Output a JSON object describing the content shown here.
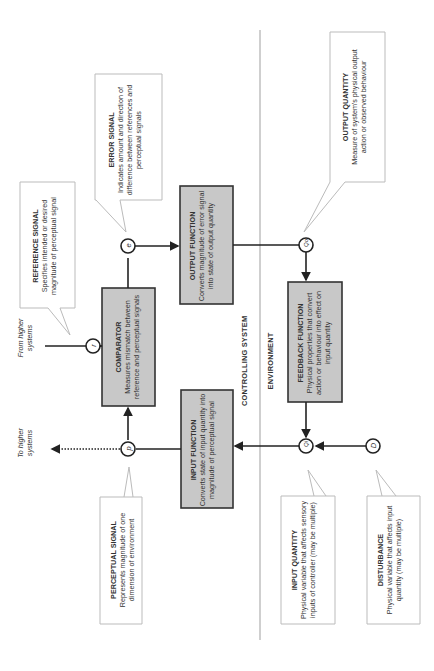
{
  "boundary": {
    "upper_label": "CONTROLLING SYSTEM",
    "lower_label": "ENVIRONMENT"
  },
  "functions": {
    "comparator": {
      "title": "COMPARATOR",
      "text": "Measures mismatch between reference and perceptual signals"
    },
    "output_function": {
      "title": "OUTPUT FUNCTION",
      "text": "Converts magnitude of error signal into state of output quantity"
    },
    "input_function": {
      "title": "INPUT FUNCTION",
      "text": "Converts state of input quantity into magnitude of perceptual signal"
    },
    "feedback_function": {
      "title": "FEEDBACK FUNCTION",
      "text": "Physical properties that convert action or behaviour into effect on input quantity"
    }
  },
  "callouts": {
    "reference_signal": {
      "title": "REFERENCE SIGNAL",
      "text": "Specifies intended or desired magnitude of perceptual signal"
    },
    "error_signal": {
      "title": "ERROR SIGNAL",
      "text": "Indicates amount and direction of difference between references and perceptual signals"
    },
    "output_quantity": {
      "title": "OUTPUT QUANTITY",
      "text": "Measure of system's physical output action or observed behaviour"
    },
    "perceptual_signal": {
      "title": "PERCEPTUAL SIGNAL",
      "text": "Represents magnitude of one dimension of environment"
    },
    "input_quantity": {
      "title": "INPUT QUANTITY",
      "text": "Physical variable that affects sensory inputs of controller (may be multiple)"
    },
    "disturbance": {
      "title": "DISTURBANCE",
      "text": "Physical variable that affects input quantity (may be multiple)"
    }
  },
  "nodes": {
    "r": "r",
    "e": "e",
    "p": "p",
    "qo": "Qo",
    "qi": "Qi",
    "d": "D"
  },
  "external": {
    "from_higher": "From higher systems",
    "to_higher": "To higher systems"
  },
  "colors": {
    "box_fill": "#c8c8c8",
    "box_stroke": "#333333",
    "callout_stroke": "#bbbbbb",
    "separator": "#bbbbbb"
  }
}
